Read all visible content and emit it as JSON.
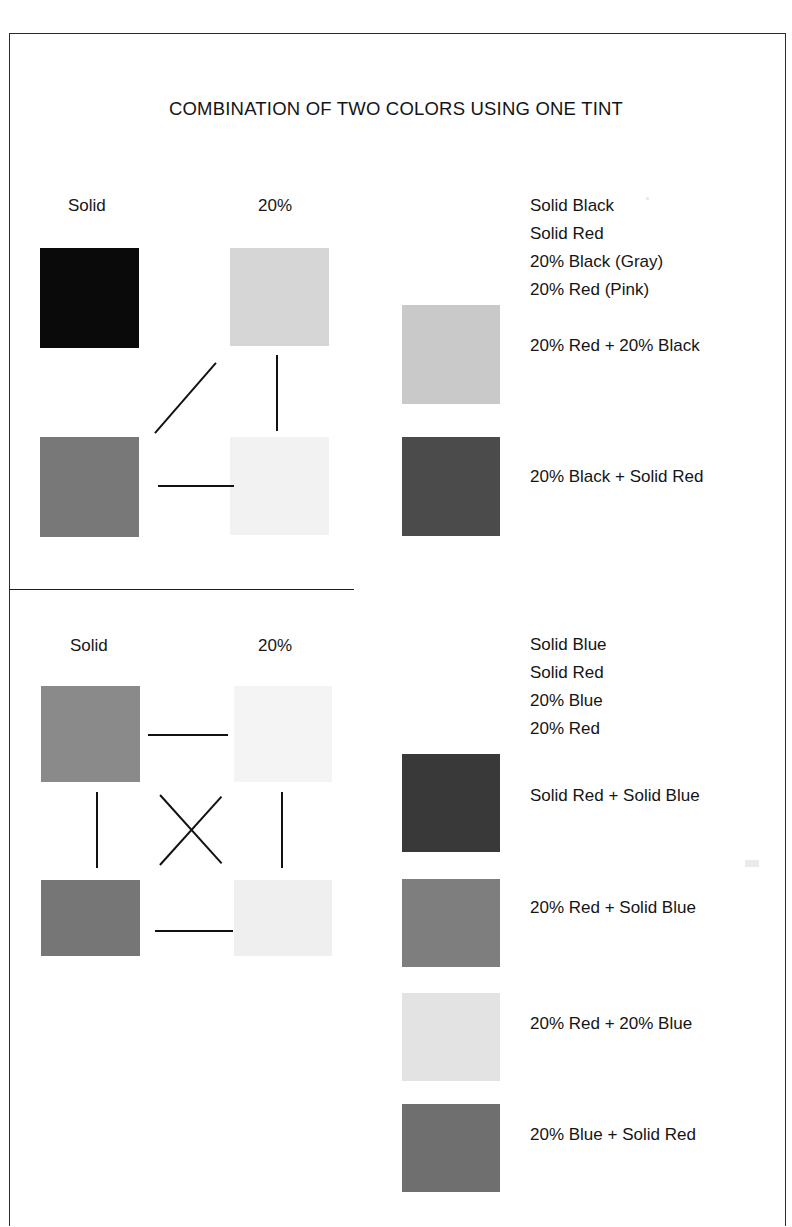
{
  "document": {
    "title": "COMBINATION OF TWO COLORS USING ONE TINT",
    "border_color": "#2b2b2b",
    "background": "#ffffff"
  },
  "sections": [
    {
      "id": "black-red",
      "column_headers": {
        "solid": "Solid",
        "tint": "20%"
      },
      "legend": [
        "Solid Black",
        "Solid Red",
        "20% Black (Gray)",
        "20% Red (Pink)"
      ],
      "results": [
        {
          "label": "20% Red + 20% Black",
          "color": "#c9c9c9"
        },
        {
          "label": "20% Black + Solid Red",
          "color": "#4b4b4b"
        }
      ],
      "grid": [
        {
          "name": "Solid Black",
          "role": "solid-row1",
          "color": "#0a0a0a"
        },
        {
          "name": "20% Black (Gray)",
          "role": "tint-row1",
          "color": "#d6d6d6"
        },
        {
          "name": "Solid Red",
          "role": "solid-row2",
          "color": "#787878"
        },
        {
          "name": "20% Red (Pink)",
          "role": "tint-row2",
          "color": "#f2f2f2"
        }
      ],
      "connectors": [
        "diagonal-up",
        "vertical",
        "horizontal"
      ]
    },
    {
      "id": "blue-red",
      "column_headers": {
        "solid": "Solid",
        "tint": "20%"
      },
      "legend": [
        "Solid Blue",
        "Solid Red",
        "20% Blue",
        "20% Red"
      ],
      "results": [
        {
          "label": "Solid Red + Solid Blue",
          "color": "#393939"
        },
        {
          "label": "20% Red + Solid Blue",
          "color": "#7e7e7e"
        },
        {
          "label": "20% Red + 20% Blue",
          "color": "#e3e3e3"
        },
        {
          "label": "20% Blue + Solid Red",
          "color": "#6f6f6f"
        }
      ],
      "grid": [
        {
          "name": "Solid Blue",
          "role": "solid-row1",
          "color": "#8a8a8a"
        },
        {
          "name": "20% Blue",
          "role": "tint-row1",
          "color": "#f4f4f4"
        },
        {
          "name": "Solid Red",
          "role": "solid-row2",
          "color": "#767676"
        },
        {
          "name": "20% Red",
          "role": "tint-row2",
          "color": "#efefef"
        }
      ],
      "connectors": [
        "horizontal-top",
        "vertical-left",
        "vertical-right",
        "cross",
        "horizontal-bottom"
      ]
    }
  ]
}
